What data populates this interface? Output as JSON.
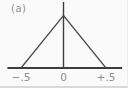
{
  "figure": {
    "panel_label": "(a)"
  },
  "chart_data": {
    "type": "line",
    "title": "",
    "xlabel": "",
    "ylabel": "",
    "series": [
      {
        "name": "triangular pulse",
        "points": [
          {
            "x": -0.5,
            "y": 0
          },
          {
            "x": 0,
            "y": 1
          },
          {
            "x": 0.5,
            "y": 0
          }
        ]
      }
    ],
    "x_ticks": [
      {
        "value": -0.5,
        "label": "−.5"
      },
      {
        "value": 0,
        "label": "0"
      },
      {
        "value": 0.5,
        "label": "+.5"
      }
    ],
    "xlim": [
      -0.66,
      0.69
    ],
    "ylim": [
      0,
      1.26
    ],
    "grid": false,
    "legend_position": "none",
    "colors": {
      "curve": "#4a4a4a",
      "axis": "#3d3d3d",
      "tick_label": "#8e8e8e",
      "panel_label": "#8e8e8e",
      "background": "#fafafa"
    }
  }
}
